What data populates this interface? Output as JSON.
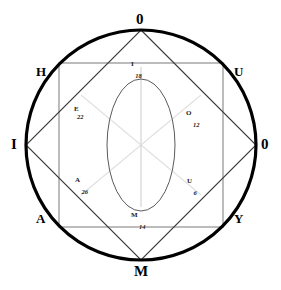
{
  "figure": {
    "title": "",
    "background_color": "#ffffff",
    "outline_color": "#000000",
    "spoke_color": "#d8d8d8",
    "shape_color": "#5a5a5a",
    "ellipse_color": "#555555"
  },
  "geometry": {
    "circle": {
      "cx": 141,
      "cy": 145,
      "r": 115,
      "stroke_width": 3.2
    },
    "diamond": {
      "cx": 141,
      "cy": 145,
      "rx": 115,
      "ry": 115,
      "stroke_width": 1
    },
    "square": {
      "x": 59,
      "y": 63,
      "width": 164,
      "height": 164,
      "stroke_width": 1
    },
    "ellipse": {
      "cx": 141,
      "cy": 145,
      "rx": 34,
      "ry": 66,
      "stroke_width": 1
    },
    "spoke_length": 78
  },
  "cardinals": [
    {
      "id": "top",
      "label": "0",
      "x": 136,
      "y": 12
    },
    {
      "id": "left",
      "label": "I",
      "x": 11,
      "y": 137
    },
    {
      "id": "right",
      "label": "0",
      "x": 261,
      "y": 137
    },
    {
      "id": "bottom",
      "label": "M",
      "x": 134,
      "y": 264
    }
  ],
  "corners": [
    {
      "id": "upper-left",
      "label": "H",
      "x": 36,
      "y": 65
    },
    {
      "id": "upper-right",
      "label": "U",
      "x": 234,
      "y": 65
    },
    {
      "id": "lower-left",
      "label": "A",
      "x": 36,
      "y": 212
    },
    {
      "id": "lower-right",
      "label": "Y",
      "x": 234,
      "y": 212
    }
  ],
  "spokes": [
    {
      "id": "north",
      "letter": "I",
      "number": "18",
      "angle_deg": 90,
      "label_x": 131,
      "label_y": 61,
      "stacked": false
    },
    {
      "id": "northwest",
      "letter": "E",
      "number": "22",
      "angle_deg": 140,
      "label_x": 74,
      "label_y": 106,
      "stacked": true
    },
    {
      "id": "northeast",
      "letter": "O",
      "number": "12",
      "angle_deg": 40,
      "label_x": 186,
      "label_y": 110,
      "stacked": false
    },
    {
      "id": "southwest",
      "letter": "A",
      "number": "26",
      "angle_deg": 220,
      "label_x": 75,
      "label_y": 177,
      "stacked": false
    },
    {
      "id": "southeast",
      "letter": "U",
      "number": "6",
      "angle_deg": 320,
      "label_x": 187,
      "label_y": 178,
      "stacked": false
    },
    {
      "id": "south",
      "letter": "M",
      "number": "14",
      "angle_deg": 270,
      "label_x": 131,
      "label_y": 212,
      "stacked": false
    }
  ]
}
